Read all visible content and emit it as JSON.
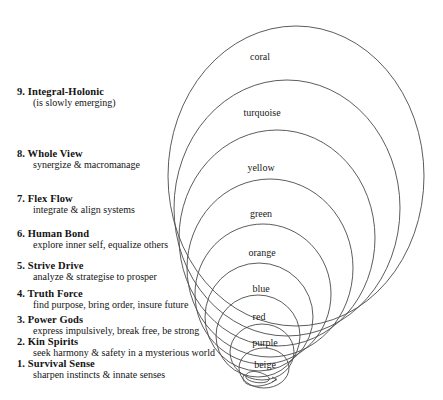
{
  "diagram": {
    "background_color": "#ffffff",
    "line_color": "#4a4a4a",
    "text_color": "#141414"
  },
  "stages": [
    {
      "number": "9.",
      "name": "Integral-Holonic",
      "description": "(is slowly emerging)",
      "color_label": "coral",
      "num_x": 17,
      "head_x": 30,
      "sub_x": 33,
      "head_y": 94,
      "sub_y": 105,
      "label_x": 260,
      "label_y": 56,
      "ellipse": {
        "cx": 296,
        "cy": 176,
        "rx": 128,
        "ry": 150
      }
    },
    {
      "number": "8.",
      "name": "Whole View",
      "description": "synergize & macromanage",
      "color_label": "turquoise",
      "num_x": 17,
      "head_x": 30,
      "sub_x": 33,
      "head_y": 156,
      "sub_y": 167,
      "label_x": 262,
      "label_y": 112,
      "ellipse": {
        "cx": 287,
        "cy": 208,
        "rx": 113,
        "ry": 128
      }
    },
    {
      "number": "7.",
      "name": "Flex Flow",
      "description": "integrate & align systems",
      "color_label": "yellow",
      "num_x": 17,
      "head_x": 30,
      "sub_x": 33,
      "head_y": 201,
      "sub_y": 212,
      "label_x": 261,
      "label_y": 167,
      "ellipse": {
        "cx": 277,
        "cy": 238,
        "rx": 98,
        "ry": 108
      }
    },
    {
      "number": "6.",
      "name": "Human Bond",
      "description": "explore inner self, equalize others",
      "color_label": "green",
      "num_x": 17,
      "head_x": 30,
      "sub_x": 33,
      "head_y": 236,
      "sub_y": 247,
      "label_x": 261,
      "label_y": 213,
      "ellipse": {
        "cx": 270,
        "cy": 268,
        "rx": 83,
        "ry": 89
      }
    },
    {
      "number": "5.",
      "name": "Strive Drive",
      "description": "analyze & strategise to prosper",
      "color_label": "orange",
      "num_x": 17,
      "head_x": 30,
      "sub_x": 33,
      "head_y": 268,
      "sub_y": 279,
      "label_x": 262,
      "label_y": 252,
      "ellipse": {
        "cx": 263,
        "cy": 294,
        "rx": 68,
        "ry": 70
      }
    },
    {
      "number": "4.",
      "name": "Truth Force",
      "description": "find purpose, bring order, insure future",
      "color_label": "blue",
      "num_x": 17,
      "head_x": 30,
      "sub_x": 33,
      "head_y": 296,
      "sub_y": 307,
      "label_x": 261,
      "label_y": 288,
      "ellipse": {
        "cx": 259,
        "cy": 317,
        "rx": 54,
        "ry": 54
      }
    },
    {
      "number": "3.",
      "name": "Power Gods",
      "description": "express impulsively, break free,  be strong",
      "color_label": "red",
      "num_x": 17,
      "head_x": 30,
      "sub_x": 33,
      "head_y": 322,
      "sub_y": 333,
      "label_x": 259,
      "label_y": 316,
      "ellipse": {
        "cx": 258,
        "cy": 336,
        "rx": 42,
        "ry": 41
      }
    },
    {
      "number": "2.",
      "name": "Kin Spirits",
      "description": "seek harmony & safety in a mysterious world",
      "color_label": "purple",
      "num_x": 17,
      "head_x": 30,
      "sub_x": 33,
      "head_y": 344,
      "sub_y": 355,
      "label_x": 265,
      "label_y": 342,
      "ellipse": {
        "cx": 262,
        "cy": 352,
        "rx": 32,
        "ry": 28
      }
    },
    {
      "number": "1.",
      "name": "Survival Sense",
      "description": "sharpen instincts & innate senses",
      "color_label": "beige",
      "num_x": 17,
      "head_x": 30,
      "sub_x": 33,
      "head_y": 366,
      "sub_y": 377,
      "label_x": 265,
      "label_y": 364,
      "ellipse": {
        "cx": 264,
        "cy": 368,
        "rx": 25,
        "ry": 20
      }
    }
  ]
}
